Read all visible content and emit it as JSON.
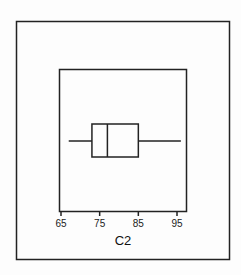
{
  "chart_data": {
    "type": "boxplot",
    "title": "",
    "xlabel": "C2",
    "ylabel": "",
    "orientation": "horizontal",
    "xlim": [
      63,
      97
    ],
    "ticks": [
      65,
      75,
      85,
      95
    ],
    "tick_labels": [
      "65",
      "75",
      "85",
      "95"
    ],
    "grid": false,
    "series": [
      {
        "name": "C2",
        "whisker_low": 67,
        "q1": 73,
        "median": 77,
        "q3": 85,
        "whisker_high": 96
      }
    ]
  },
  "axis": {
    "title": "C2",
    "tick_labels": [
      "65",
      "75",
      "85",
      "95"
    ]
  }
}
